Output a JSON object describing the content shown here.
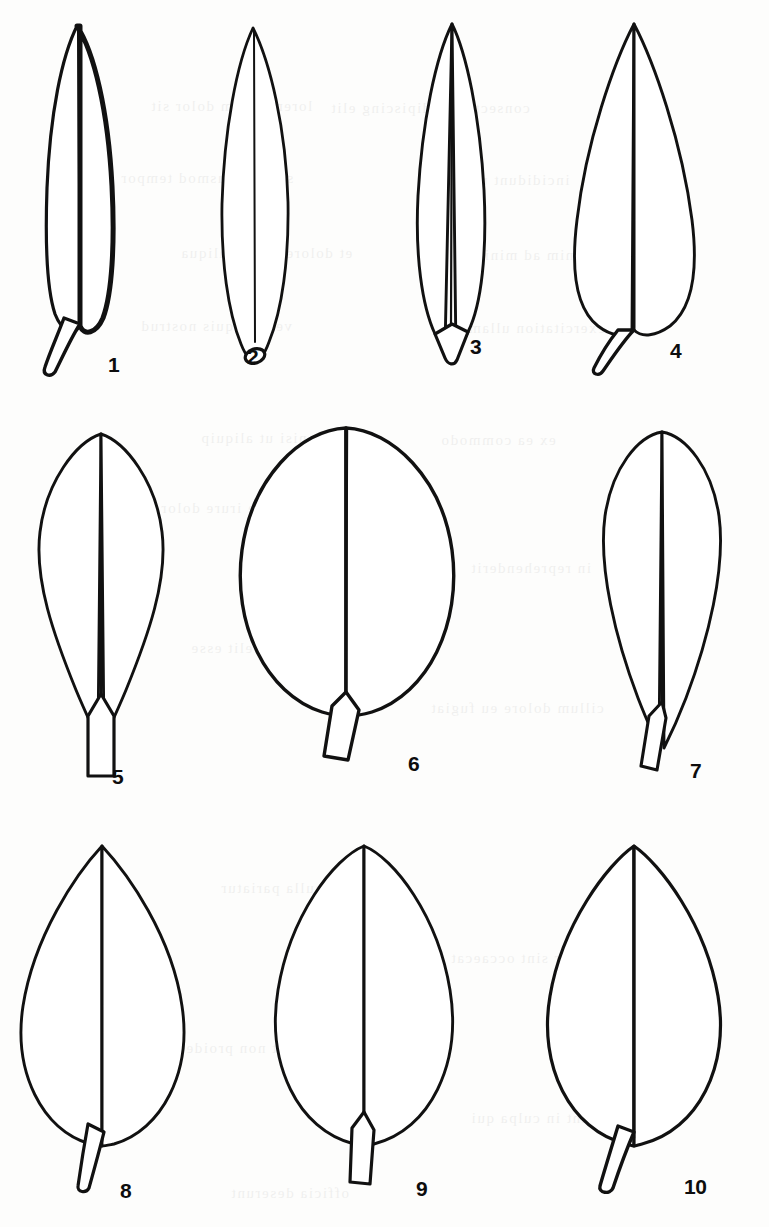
{
  "plate": {
    "title": "Leaf shape outline plate",
    "description": "Ten numbered leaf silhouette outlines arranged in three rows, each drawn with an outline, a central midrib and a basal petiole.",
    "background_color": "#fdfdfc",
    "ink_color": "#111111",
    "width": 769,
    "height": 1227,
    "rows": 3,
    "figure_count": 10
  },
  "figures": [
    {
      "number": "1",
      "shape": "oblong-lanceolate",
      "apex": "acute",
      "base": "attenuate",
      "petiole": "long curved petiole",
      "label_x": 108,
      "label_y": 354
    },
    {
      "number": "2",
      "shape": "linear-lanceolate",
      "apex": "acuminate",
      "base": "attenuate",
      "petiole": "sessile, rounded tip",
      "label_x": 247,
      "label_y": 346
    },
    {
      "number": "3",
      "shape": "narrowly lanceolate",
      "apex": "acuminate",
      "base": "attenuate",
      "petiole": "short tapering petiole",
      "label_x": 470,
      "label_y": 336
    },
    {
      "number": "4",
      "shape": "ovate-lanceolate",
      "apex": "acuminate",
      "base": "obtuse",
      "petiole": "short angled petiole",
      "label_x": 670,
      "label_y": 340
    },
    {
      "number": "5",
      "shape": "obovate-spatulate",
      "apex": "rounded",
      "base": "long-attenuate",
      "petiole": "straight vertical petiole",
      "label_x": 112,
      "label_y": 766
    },
    {
      "number": "6",
      "shape": "orbicular",
      "apex": "rounded",
      "base": "rounded",
      "petiole": "short angled petiole",
      "label_x": 408,
      "label_y": 753
    },
    {
      "number": "7",
      "shape": "obovate",
      "apex": "rounded",
      "base": "cuneate",
      "petiole": "narrow tapering petiole",
      "label_x": 690,
      "label_y": 760
    },
    {
      "number": "8",
      "shape": "broadly ovate",
      "apex": "acuminate",
      "base": "rounded",
      "petiole": "short oblique petiole",
      "label_x": 120,
      "label_y": 1180
    },
    {
      "number": "9",
      "shape": "broadly elliptic",
      "apex": "obtuse",
      "base": "rounded",
      "petiole": "short straight petiole",
      "label_x": 416,
      "label_y": 1178
    },
    {
      "number": "10",
      "shape": "broadly ovate",
      "apex": "acute",
      "base": "rounded",
      "petiole": "short oblique petiole",
      "label_x": 684,
      "label_y": 1176
    }
  ],
  "bleed_through": {
    "note": "illegible faint text showing through from the reverse of the page",
    "lines": [
      {
        "text": "lorem ipsum dolor sit",
        "x": 150,
        "y": 98
      },
      {
        "text": "consectetur adipiscing elit",
        "x": 330,
        "y": 100
      },
      {
        "text": "sed do eiusmod tempor",
        "x": 120,
        "y": 170
      },
      {
        "text": "incididunt ut labore",
        "x": 420,
        "y": 172
      },
      {
        "text": "et dolore magna aliqua",
        "x": 180,
        "y": 245
      },
      {
        "text": "ut enim ad minim",
        "x": 470,
        "y": 247
      },
      {
        "text": "veniam quis nostrud",
        "x": 140,
        "y": 318
      },
      {
        "text": "exercitation ullamco",
        "x": 450,
        "y": 320
      },
      {
        "text": "laboris nisi ut aliquip",
        "x": 200,
        "y": 430
      },
      {
        "text": "ex ea commodo",
        "x": 440,
        "y": 432
      },
      {
        "text": "duis aute irure dolor",
        "x": 160,
        "y": 500
      },
      {
        "text": "in reprehenderit",
        "x": 470,
        "y": 560
      },
      {
        "text": "voluptate velit esse",
        "x": 190,
        "y": 640
      },
      {
        "text": "cillum dolore eu fugiat",
        "x": 430,
        "y": 700
      },
      {
        "text": "nulla pariatur",
        "x": 220,
        "y": 880
      },
      {
        "text": "excepteur sint occaecat",
        "x": 450,
        "y": 950
      },
      {
        "text": "cupidatat non proident",
        "x": 170,
        "y": 1040
      },
      {
        "text": "sunt in culpa qui",
        "x": 470,
        "y": 1110
      },
      {
        "text": "officia deserunt",
        "x": 230,
        "y": 1185
      }
    ]
  }
}
